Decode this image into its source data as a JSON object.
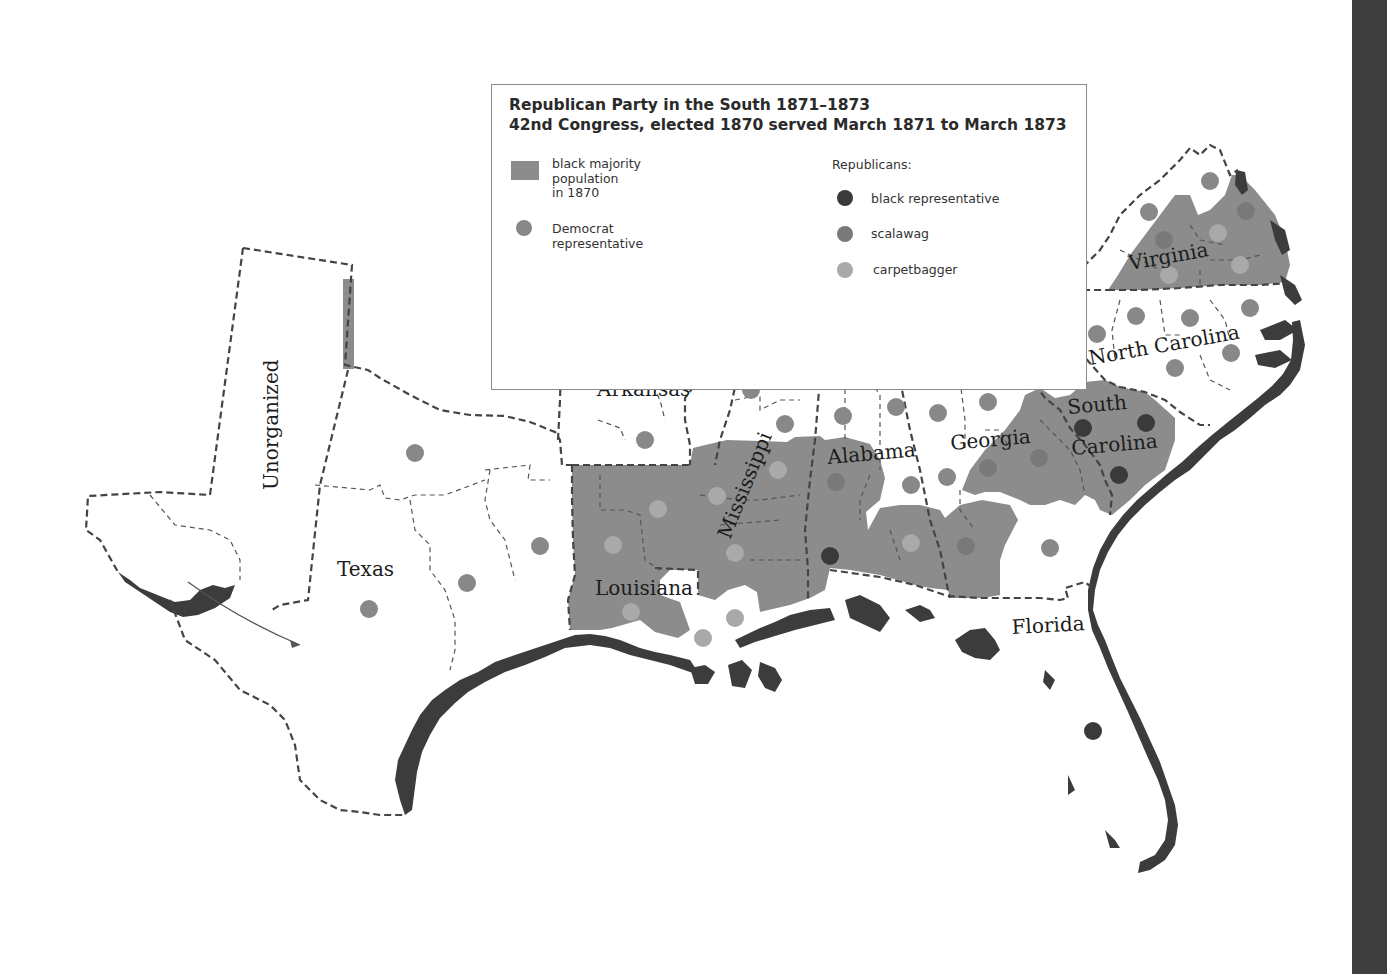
{
  "legend": {
    "title_line1": "Republican Party in the South 1871–1873",
    "title_line2": "42nd Congress, elected 1870 served March 1871 to March 1873",
    "black_majority_label_1": "black majority",
    "black_majority_label_2": "population",
    "black_majority_label_3": "in 1870",
    "democrat_label_1": "Democrat",
    "democrat_label_2": "representative",
    "republicans_heading": "Republicans:",
    "black_rep_label": "black representative",
    "scalawag_label": "scalawag",
    "carpetbagger_label": "carpetbagger"
  },
  "colors": {
    "black_majority": "#8c8c8c",
    "democrat": "#888888",
    "black_representative": "#3a3a3a",
    "scalawag": "#797979",
    "carpetbagger": "#a9a9a9",
    "coast": "#3c3c3c",
    "land": "#ffffff",
    "border": "#444444"
  },
  "state_labels": {
    "unorganized": "Unorganized",
    "texas": "Texas",
    "arkansas": "Arkansas",
    "louisiana": "Louisiana",
    "mississippi": "Mississippi",
    "tennessee": "Tennessee",
    "alabama": "Alabama",
    "georgia": "Georgia",
    "south": "South",
    "carolina": "Carolina",
    "north_carolina": "North Carolina",
    "virginia": "Virginia",
    "florida": "Florida"
  },
  "representatives": [
    {
      "state": "Texas",
      "type": "democrat",
      "x": 415,
      "y": 453
    },
    {
      "state": "Texas",
      "type": "democrat",
      "x": 369,
      "y": 609
    },
    {
      "state": "Texas",
      "type": "democrat",
      "x": 467,
      "y": 583
    },
    {
      "state": "Texas",
      "type": "democrat",
      "x": 540,
      "y": 546
    },
    {
      "state": "Arkansas",
      "type": "democrat",
      "x": 594,
      "y": 351
    },
    {
      "state": "Arkansas",
      "type": "democrat",
      "x": 690,
      "y": 354
    },
    {
      "state": "Arkansas",
      "type": "democrat",
      "x": 645,
      "y": 440
    },
    {
      "state": "Louisiana",
      "type": "carpetbagger",
      "x": 658,
      "y": 509
    },
    {
      "state": "Louisiana",
      "type": "carpetbagger",
      "x": 613,
      "y": 545
    },
    {
      "state": "Louisiana",
      "type": "carpetbagger",
      "x": 631,
      "y": 612
    },
    {
      "state": "Louisiana",
      "type": "carpetbagger",
      "x": 703,
      "y": 638
    },
    {
      "state": "Mississippi",
      "type": "carpetbagger",
      "x": 717,
      "y": 496
    },
    {
      "state": "Mississippi",
      "type": "carpetbagger",
      "x": 735,
      "y": 553
    },
    {
      "state": "Mississippi",
      "type": "carpetbagger",
      "x": 778,
      "y": 470
    },
    {
      "state": "Mississippi",
      "type": "carpetbagger",
      "x": 735,
      "y": 618
    },
    {
      "state": "Tennessee",
      "type": "democrat",
      "x": 787,
      "y": 321
    },
    {
      "state": "Tennessee",
      "type": "democrat",
      "x": 777,
      "y": 355
    },
    {
      "state": "Tennessee",
      "type": "democrat",
      "x": 751,
      "y": 390
    },
    {
      "state": "Tennessee",
      "type": "democrat",
      "x": 785,
      "y": 424
    },
    {
      "state": "Tennessee",
      "type": "democrat",
      "x": 835,
      "y": 349
    },
    {
      "state": "Tennessee",
      "type": "democrat",
      "x": 875,
      "y": 314
    },
    {
      "state": "Tennessee",
      "type": "democrat",
      "x": 923,
      "y": 331
    },
    {
      "state": "Tennessee",
      "type": "democrat",
      "x": 967,
      "y": 327
    },
    {
      "state": "Tennessee",
      "type": "democrat",
      "x": 1014,
      "y": 314
    },
    {
      "state": "Alabama",
      "type": "democrat",
      "x": 843,
      "y": 416
    },
    {
      "state": "Alabama",
      "type": "democrat",
      "x": 896,
      "y": 407
    },
    {
      "state": "Alabama",
      "type": "democrat",
      "x": 938,
      "y": 413
    },
    {
      "state": "Alabama",
      "type": "scalawag",
      "x": 836,
      "y": 482
    },
    {
      "state": "Alabama",
      "type": "black_representative",
      "x": 830,
      "y": 556
    },
    {
      "state": "Alabama",
      "type": "democrat",
      "x": 911,
      "y": 485
    },
    {
      "state": "Alabama",
      "type": "carpetbagger",
      "x": 911,
      "y": 543
    },
    {
      "state": "Georgia",
      "type": "democrat",
      "x": 947,
      "y": 477
    },
    {
      "state": "Georgia",
      "type": "democrat",
      "x": 988,
      "y": 402
    },
    {
      "state": "Georgia",
      "type": "scalawag",
      "x": 988,
      "y": 468
    },
    {
      "state": "Georgia",
      "type": "scalawag",
      "x": 1039,
      "y": 458
    },
    {
      "state": "Georgia",
      "type": "scalawag",
      "x": 966,
      "y": 546
    },
    {
      "state": "Georgia",
      "type": "democrat",
      "x": 1050,
      "y": 548
    },
    {
      "state": "Georgia",
      "type": "democrat",
      "x": 1065,
      "y": 381
    },
    {
      "state": "South Carolina",
      "type": "black_representative",
      "x": 1083,
      "y": 428
    },
    {
      "state": "South Carolina",
      "type": "black_representative",
      "x": 1146,
      "y": 423
    },
    {
      "state": "South Carolina",
      "type": "black_representative",
      "x": 1119,
      "y": 475
    },
    {
      "state": "North Carolina",
      "type": "democrat",
      "x": 1033,
      "y": 348
    },
    {
      "state": "North Carolina",
      "type": "democrat",
      "x": 1056,
      "y": 336
    },
    {
      "state": "North Carolina",
      "type": "democrat",
      "x": 1097,
      "y": 334
    },
    {
      "state": "North Carolina",
      "type": "democrat",
      "x": 1136,
      "y": 316
    },
    {
      "state": "North Carolina",
      "type": "democrat",
      "x": 1190,
      "y": 318
    },
    {
      "state": "North Carolina",
      "type": "democrat",
      "x": 1175,
      "y": 368
    },
    {
      "state": "North Carolina",
      "type": "democrat",
      "x": 1231,
      "y": 353
    },
    {
      "state": "North Carolina",
      "type": "democrat",
      "x": 1250,
      "y": 308
    },
    {
      "state": "North Carolina",
      "type": "democrat",
      "x": 1064,
      "y": 380
    },
    {
      "state": "Virginia",
      "type": "democrat",
      "x": 1072,
      "y": 274
    },
    {
      "state": "Virginia",
      "type": "democrat",
      "x": 1149,
      "y": 212
    },
    {
      "state": "Virginia",
      "type": "democrat",
      "x": 1210,
      "y": 181
    },
    {
      "state": "Virginia",
      "type": "scalawag",
      "x": 1164,
      "y": 240
    },
    {
      "state": "Virginia",
      "type": "carpetbagger",
      "x": 1218,
      "y": 233
    },
    {
      "state": "Virginia",
      "type": "scalawag",
      "x": 1246,
      "y": 211
    },
    {
      "state": "Virginia",
      "type": "carpetbagger",
      "x": 1240,
      "y": 265
    },
    {
      "state": "Virginia",
      "type": "carpetbagger",
      "x": 1169,
      "y": 275
    },
    {
      "state": "Florida",
      "type": "black_representative",
      "x": 1093,
      "y": 731
    }
  ]
}
